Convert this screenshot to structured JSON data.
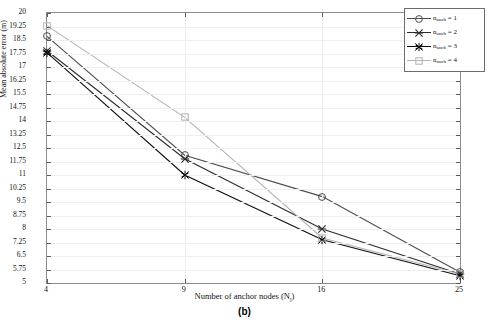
{
  "panel_label": "(b)",
  "axes": {
    "xlabel_main": "Number of anchor nodes (N",
    "xlabel_sub": "l",
    "xlabel_close": ")",
    "ylabel": "Mean absolute error (m)"
  },
  "legend": {
    "entries": [
      {
        "name": "n",
        "sub": "anch",
        "eq": " = 1",
        "color": "#4d4d4d",
        "marker": "circle"
      },
      {
        "name": "n",
        "sub": "anch",
        "eq": " = 2",
        "color": "#2b2b2b",
        "marker": "asterisk"
      },
      {
        "name": "n",
        "sub": "anch",
        "eq": " = 3",
        "color": "#0d0d0d",
        "marker": "star"
      },
      {
        "name": "n",
        "sub": "anch",
        "eq": " = 4",
        "color": "#b3b3b3",
        "marker": "square"
      }
    ]
  },
  "chart_data": {
    "type": "line",
    "title": "",
    "xlabel": "Number of anchor nodes (N_l)",
    "ylabel": "Mean absolute error (m)",
    "x": [
      4,
      9,
      16,
      25
    ],
    "xtick_labels": [
      "4",
      "9",
      "16",
      "25"
    ],
    "xlim": [
      4,
      25
    ],
    "xscale": "categorical",
    "ylim": [
      5,
      20
    ],
    "ytick_labels": [
      "5",
      "5.75",
      "6.5",
      "7.25",
      "8",
      "8.75",
      "9.5",
      "10.25",
      "11",
      "11.75",
      "12.5",
      "13.25",
      "14",
      "14.75",
      "15.5",
      "16.25",
      "17",
      "17.75",
      "18.5",
      "19.25",
      "20"
    ],
    "ytick_values": [
      5,
      5.75,
      6.5,
      7.25,
      8,
      8.75,
      9.5,
      10.25,
      11,
      11.75,
      12.5,
      13.25,
      14,
      14.75,
      15.5,
      16.25,
      17,
      17.75,
      18.5,
      19.25,
      20
    ],
    "grid": true,
    "legend_position": "upper-right",
    "series": [
      {
        "name": "n_anch = 1",
        "marker": "circle",
        "color": "#4d4d4d",
        "values": [
          18.7,
          12.1,
          9.8,
          5.6
        ]
      },
      {
        "name": "n_anch = 2",
        "marker": "asterisk",
        "color": "#2b2b2b",
        "values": [
          17.9,
          11.9,
          8.0,
          5.5
        ]
      },
      {
        "name": "n_anch = 3",
        "marker": "star",
        "color": "#0d0d0d",
        "values": [
          17.8,
          11.0,
          7.4,
          5.4
        ]
      },
      {
        "name": "n_anch = 4",
        "marker": "square",
        "color": "#b3b3b3",
        "values": [
          19.3,
          14.2,
          7.5,
          5.5
        ]
      }
    ]
  }
}
